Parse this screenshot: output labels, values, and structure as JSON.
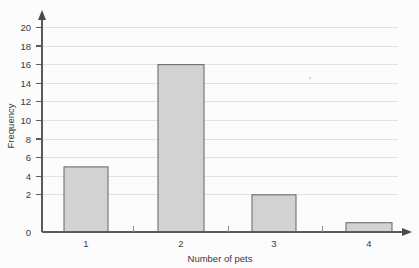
{
  "chart_data": {
    "type": "bar",
    "title": "",
    "subtitle": "",
    "xlabel": "Number of pets",
    "ylabel": "Frequency",
    "categories": [
      "1",
      "2",
      "3",
      "4"
    ],
    "values": [
      7,
      18,
      4,
      1
    ],
    "ylim": [
      0,
      20
    ],
    "y_ticks": [
      0,
      2,
      4,
      6,
      8,
      10,
      12,
      14,
      16,
      18,
      20
    ],
    "y_tick_labels": [
      "0",
      "2",
      "4",
      "6",
      "8",
      "10",
      "12",
      "14",
      "16",
      "18",
      "20"
    ],
    "grid": "horizontal",
    "legend": "none",
    "series": [
      {
        "name": "Frequency",
        "values": [
          7,
          18,
          4,
          1
        ]
      }
    ],
    "colors": {
      "bar_fill": "#d2d2d2",
      "bar_border": "#6e6e6e",
      "gridline": "#e2e2e2",
      "axis": "#5a5a5a",
      "text": "#3a3a3a",
      "background": "#fcfcfc"
    },
    "axis_style": {
      "y_axis_arrow": true,
      "x_axis_arrow": true,
      "x_minor_ticks": true
    }
  },
  "labels": {
    "y_axis_title": "Frequency",
    "x_axis_title": "Number of pets",
    "y_tick_20": "20",
    "y_tick_18": "18",
    "y_tick_16": "16",
    "y_tick_14": "14",
    "y_tick_12": "12",
    "y_tick_10": "10",
    "y_tick_8": "8",
    "y_tick_6": "6",
    "y_tick_4": "4",
    "y_tick_2": "2",
    "y_tick_0": "0",
    "x_tick_1": "1",
    "x_tick_2": "2",
    "x_tick_3": "3",
    "x_tick_4": "4"
  }
}
